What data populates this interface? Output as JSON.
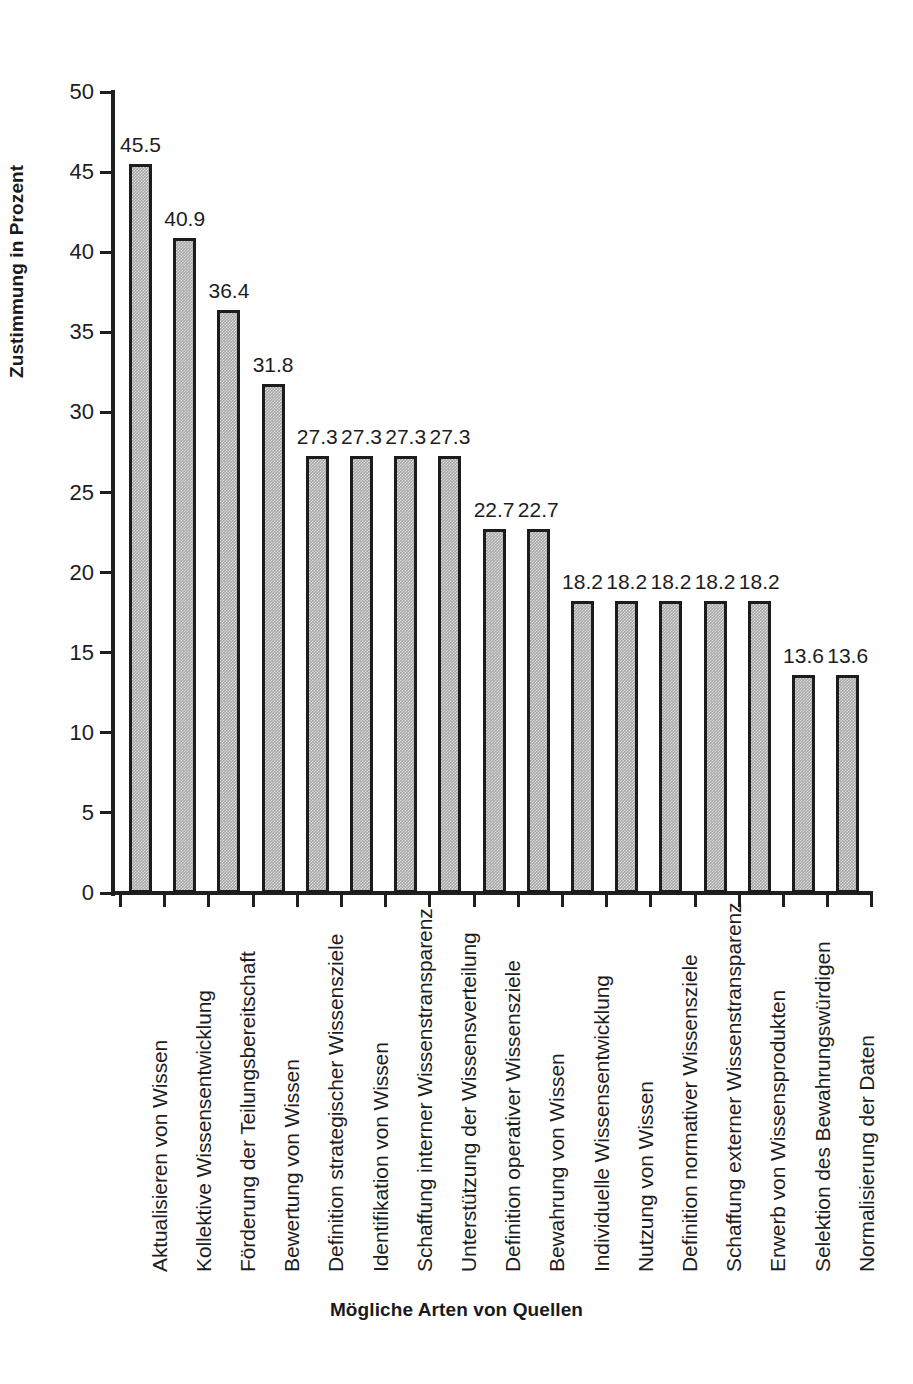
{
  "chart_data": {
    "type": "bar",
    "title": "",
    "xlabel": "Mögliche Arten von Quellen",
    "ylabel": "Zustimmung in Prozent",
    "ylim": [
      0,
      50
    ],
    "ytick_step": 5,
    "yticks": [
      "50",
      "45",
      "40",
      "35",
      "30",
      "25",
      "20",
      "15",
      "10",
      "5",
      "0"
    ],
    "grid": false,
    "legend": false,
    "orientation": "vertical",
    "bar_color": "#a8a8a8",
    "bar_border_color": "#1c1c1c",
    "background_color": "#ffffff",
    "text_color": "#1d1d1d",
    "categories": [
      "Aktualisieren von Wissen",
      "Kollektive Wissensentwicklung",
      "Förderung der Teilungsbereitschaft",
      "Bewertung von Wissen",
      "Definition strategischer Wissensziele",
      "Identifikation von Wissen",
      "Schaffung interner Wissenstransparenz",
      "Unterstützung der Wissensverteilung",
      "Definition operativer Wissensziele",
      "Bewahrung von Wissen",
      "Individuelle Wissensentwicklung",
      "Nutzung von Wissen",
      "Definition normativer Wissensziele",
      "Schaffung externer Wissenstransparenz",
      "Erwerb von Wissensprodukten",
      "Selektion des Bewahrungswürdigen",
      "Normalisierung der Daten"
    ],
    "values": [
      45.5,
      40.9,
      36.4,
      31.8,
      27.3,
      27.3,
      27.3,
      27.3,
      22.7,
      22.7,
      18.2,
      18.2,
      18.2,
      18.2,
      18.2,
      13.6,
      13.6
    ],
    "value_labels": [
      "45.5",
      "40.9",
      "36.4",
      "31.8",
      "27.3",
      "27.3",
      "27.3",
      "27.3",
      "22.7",
      "22.7",
      "18.2",
      "18.2",
      "18.2",
      "18.2",
      "18.2",
      "13.6",
      "13.6"
    ]
  }
}
